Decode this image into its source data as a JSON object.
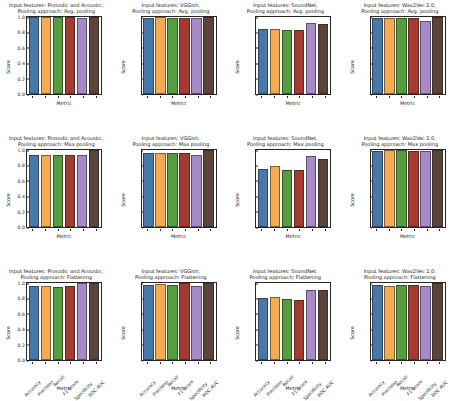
{
  "figure": {
    "width": 458,
    "height": 399,
    "background": "#ffffff",
    "rows": 3,
    "cols": 4
  },
  "axis": {
    "ylabel": "Score",
    "xlabel": "Metric",
    "yticks": [
      "0.0",
      "0.2",
      "0.4",
      "0.6",
      "0.8",
      "1.0"
    ],
    "ylim": [
      0,
      1.0
    ]
  },
  "palette": {
    "accuracy": "#4878a8",
    "precision": "#f5ab52",
    "recall": "#559e3e",
    "f1_score": "#a63a33",
    "specificity": "#a68bc8",
    "roc_auc": "#5c4439"
  },
  "chart_data": {
    "type": "bar",
    "title": "",
    "xlabel": "Metric",
    "ylabel": "Score",
    "ylim": [
      0,
      1.0
    ],
    "grid": false,
    "legend_position": "none",
    "categories": [
      "Accuracy",
      "Precision",
      "Recall",
      "F1-Score",
      "Specificity",
      "ROC AUC"
    ],
    "colors": [
      "#4878a8",
      "#f5ab52",
      "#559e3e",
      "#a63a33",
      "#a68bc8",
      "#5c4439"
    ],
    "panels": [
      {
        "row": 0,
        "col": 0,
        "input_features": "Prosodic and Acoustic",
        "pooling_approach": "Avg. pooling",
        "title": "Input features: Prosodic and Acoustic,\nPooling approach: Avg. pooling",
        "values": [
          1.0,
          1.0,
          1.0,
          1.0,
          0.99,
          1.0
        ]
      },
      {
        "row": 0,
        "col": 1,
        "input_features": "VGGish",
        "pooling_approach": "Avg. pooling",
        "title": "Input features: VGGish,\nPooling approach: Avg. pooling",
        "values": [
          0.99,
          1.0,
          0.99,
          0.99,
          0.985,
          1.0
        ]
      },
      {
        "row": 0,
        "col": 2,
        "input_features": "SoundNet",
        "pooling_approach": "Avg. pooling",
        "title": "Input features: SoundNet,\nPooling approach: Avg. pooling",
        "values": [
          0.84,
          0.85,
          0.835,
          0.835,
          0.925,
          0.91
        ]
      },
      {
        "row": 0,
        "col": 3,
        "input_features": "Wav2Vec 2.0",
        "pooling_approach": "Avg. pooling",
        "title": "Input features: Wav2Vec 2.0,\nPooling approach: Avg. pooling",
        "values": [
          0.985,
          0.99,
          0.985,
          0.99,
          0.945,
          1.0
        ]
      },
      {
        "row": 1,
        "col": 0,
        "input_features": "Prosodic and Acoustic",
        "pooling_approach": "Max pooling",
        "title": "Input features: Prosodic and Acoustic,\nPooling approach: Max pooling",
        "values": [
          0.94,
          0.94,
          0.935,
          0.935,
          0.93,
          1.0
        ]
      },
      {
        "row": 1,
        "col": 1,
        "input_features": "VGGish",
        "pooling_approach": "Max pooling",
        "title": "Input features: VGGish,\nPooling approach: Max pooling",
        "values": [
          0.965,
          0.965,
          0.96,
          0.965,
          0.93,
          1.0
        ]
      },
      {
        "row": 1,
        "col": 2,
        "input_features": "SoundNet",
        "pooling_approach": "Max pooling",
        "title": "Input features: SoundNet,\nPooling approach: Max pooling",
        "values": [
          0.755,
          0.79,
          0.745,
          0.74,
          0.925,
          0.885
        ]
      },
      {
        "row": 1,
        "col": 3,
        "input_features": "Wav2Vec 2.0",
        "pooling_approach": "Max pooling",
        "title": "Input features: Wav2Vec 2.0,\nPooling approach: Max pooling",
        "values": [
          0.985,
          1.0,
          1.0,
          0.99,
          0.985,
          1.0
        ]
      },
      {
        "row": 2,
        "col": 0,
        "input_features": "Prosodic and Acoustic",
        "pooling_approach": "Flattening",
        "title": "Input features: Prosodic and Acoustic,\nPooling approach: Flattening",
        "values": [
          0.955,
          0.955,
          0.95,
          0.955,
          0.995,
          1.0
        ]
      },
      {
        "row": 2,
        "col": 1,
        "input_features": "VGGish",
        "pooling_approach": "Flattening",
        "title": "Input features: VGGish,\nPooling approach: Flattening",
        "values": [
          0.975,
          0.985,
          0.975,
          0.995,
          0.96,
          1.0
        ]
      },
      {
        "row": 2,
        "col": 2,
        "input_features": "SoundNet",
        "pooling_approach": "Flattening",
        "title": "Input features: SoundNet,\nPooling approach: Flattening",
        "values": [
          0.8,
          0.815,
          0.79,
          0.785,
          0.915,
          0.91
        ]
      },
      {
        "row": 2,
        "col": 3,
        "input_features": "Wav2Vec 2.0",
        "pooling_approach": "Flattening",
        "title": "Input features: Wav2Vec 2.0,\nPooling approach: Flattening",
        "values": [
          0.975,
          0.965,
          0.975,
          0.97,
          0.955,
          1.0
        ]
      }
    ]
  }
}
